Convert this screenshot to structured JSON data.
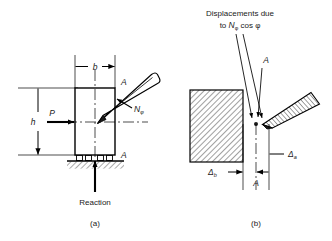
{
  "figure": {
    "title_implied": "Column with inclined strut: forces and displacements",
    "panels": [
      {
        "id": "a",
        "caption": "(a)",
        "labels": {
          "width_dim": "b",
          "height_dim": "h",
          "applied_force": "P",
          "strut_force": "N",
          "strut_force_subscript": "φ",
          "section_top": "A",
          "section_bottom": "A",
          "support_note": "Reaction"
        }
      },
      {
        "id": "b",
        "caption": "(b)",
        "labels": {
          "annotation_line1": "Displacements due",
          "annotation_line2_pre": "to ",
          "annotation_line2_sym": "N",
          "annotation_line2_sub": "φ",
          "annotation_line2_post": " cos φ",
          "point_top": "A",
          "point_bottom": "A",
          "delta_block_sym": "Δ",
          "delta_block_sub": "b",
          "delta_strut_sym": "Δ",
          "delta_strut_sub": "a"
        }
      }
    ],
    "colors": {
      "ink": "#1a1a1a",
      "line": "#000000",
      "hatch": "#2b2b2b",
      "background": "#ffffff"
    }
  }
}
